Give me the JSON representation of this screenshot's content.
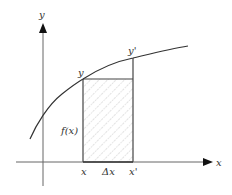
{
  "diagram": {
    "type": "function-increment-area",
    "axes": {
      "x_label": "x",
      "y_label": "y"
    },
    "curve": {
      "name": "f(x)",
      "color": "#333333"
    },
    "labels": {
      "point_y": "y",
      "point_y_prime": "y'",
      "height_label": "f(x)",
      "x_start": "x",
      "delta_x": "Δx",
      "x_end": "x'"
    },
    "rectangle": {
      "fill": "hatched",
      "hatch_color": "#aaaaaa",
      "stroke_color": "#444444"
    }
  }
}
